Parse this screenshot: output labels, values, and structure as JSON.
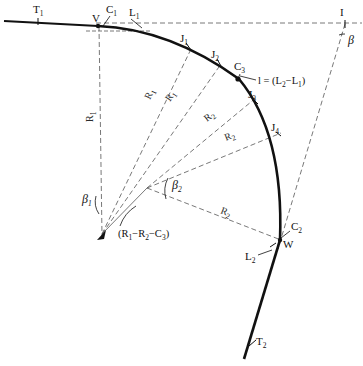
{
  "figure": {
    "type": "engineering-geometry-diagram",
    "background_color": "#ffffff",
    "line_color": "#111111",
    "dashed_color": "#555555"
  },
  "points": [
    {
      "id": "T1",
      "label": "T",
      "sub": "1",
      "x": 38,
      "y": 14,
      "tick_x": 38,
      "tick_y": 21
    },
    {
      "id": "V",
      "label": "V",
      "sub": "",
      "x": 96,
      "y": 22
    },
    {
      "id": "C1",
      "label": "C",
      "sub": "1",
      "x": 110,
      "y": 12
    },
    {
      "id": "L1",
      "label": "L",
      "sub": "1",
      "x": 133,
      "y": 15
    },
    {
      "id": "I",
      "label": "I",
      "sub": "",
      "x": 343,
      "y": 15
    },
    {
      "id": "J1",
      "label": "J",
      "sub": "1",
      "x": 183,
      "y": 41
    },
    {
      "id": "J2",
      "label": "J",
      "sub": "2",
      "x": 214,
      "y": 57
    },
    {
      "id": "C3",
      "label": "C",
      "sub": "3",
      "x": 239,
      "y": 70
    },
    {
      "id": "J3",
      "label": "J",
      "sub": "3",
      "x": 251,
      "y": 97
    },
    {
      "id": "J4",
      "label": "J",
      "sub": "4",
      "x": 274,
      "y": 130
    },
    {
      "id": "C2",
      "label": "C",
      "sub": "2",
      "x": 292,
      "y": 229
    },
    {
      "id": "W",
      "label": "W",
      "sub": "",
      "x": 285,
      "y": 242
    },
    {
      "id": "L2",
      "label": "L",
      "sub": "2",
      "x": 249,
      "y": 258
    },
    {
      "id": "T2",
      "label": "T",
      "sub": "2",
      "x": 252,
      "y": 341
    }
  ],
  "angles": [
    {
      "id": "beta",
      "label": "β",
      "sub": "",
      "x": 349,
      "y": 40
    },
    {
      "id": "beta1",
      "label": "β",
      "sub": "1",
      "x": 85,
      "y": 201
    },
    {
      "id": "beta2",
      "label": "β",
      "sub": "2",
      "x": 175,
      "y": 185
    }
  ],
  "radius_labels": [
    {
      "id": "R1-vertical",
      "label": "R",
      "sub": "1",
      "x": 93,
      "y": 122,
      "rotation": -90
    },
    {
      "id": "R1-to-J1",
      "label": "R",
      "sub": "1",
      "x": 153,
      "y": 98,
      "rotation": -57
    },
    {
      "id": "R1-to-J2",
      "label": "R",
      "sub": "1",
      "x": 172,
      "y": 100,
      "rotation": -50
    },
    {
      "id": "R2-to-J3",
      "label": "R",
      "sub": "2",
      "x": 212,
      "y": 119,
      "rotation": -30
    },
    {
      "id": "R2-to-J4",
      "label": "R",
      "sub": "2",
      "x": 229,
      "y": 138,
      "rotation": -18
    },
    {
      "id": "R2-to-W",
      "label": "R",
      "sub": "2",
      "x": 224,
      "y": 212,
      "rotation": 20
    }
  ],
  "expressions": [
    {
      "id": "chord-l",
      "text": "l = (L",
      "sub1": "2",
      "mid": "−L",
      "sub2": "1",
      "tail": ")",
      "x": 259,
      "y": 83
    },
    {
      "id": "radius-difference",
      "text": "(R",
      "sub1": "1",
      "mid": "−R",
      "sub2": "2",
      "mid2": "−C",
      "sub3": "3",
      "tail": ")",
      "x": 120,
      "y": 236
    }
  ],
  "geometry": {
    "center_R1": {
      "x": 102,
      "y": 234
    },
    "center_R2": {
      "x": 147,
      "y": 188
    },
    "vertex_V": {
      "x": 98,
      "y": 26
    },
    "point_I": {
      "x": 345,
      "y": 24
    },
    "point_W": {
      "x": 280,
      "y": 240
    },
    "tangent_start": {
      "x": 8,
      "y": 22
    },
    "curve_end": {
      "x": 245,
      "y": 358
    }
  }
}
